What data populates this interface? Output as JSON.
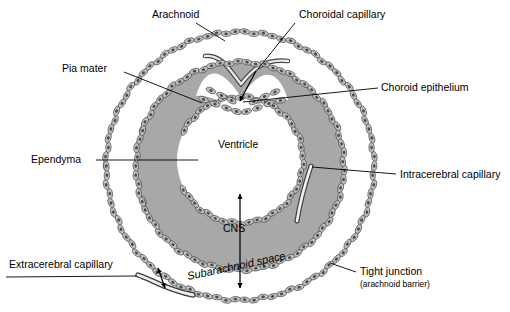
{
  "figure": {
    "background_color": "#ffffff",
    "cns_fill_color": "#a8a8a8",
    "cell_fill_color": "#b4b4b4",
    "line_color": "#000000",
    "vessel_fill_color": "#9a9a9a"
  },
  "labels": {
    "arachnoid": "Arachnoid",
    "choroidal_capillary": "Choroidal capillary",
    "pia_mater": "Pia mater",
    "choroid_epithelium": "Choroid epithelium",
    "ependyma": "Ependyma",
    "ventricle": "Ventricle",
    "intracerebral_capillary": "Intracerebral capillary",
    "cns": "CNS",
    "extracerebral_capillary": "Extracerebral capillary",
    "subarachnoid_space": "Subarachnoid space",
    "tight_junction": "Tight junction",
    "tight_junction_sub": "(arachnoid barrier)"
  },
  "geometry": {
    "outer_circle": {
      "cx": 240,
      "cy": 166,
      "r": 134,
      "name": "arachnoid-membrane"
    },
    "pia_circle": {
      "cx": 240,
      "cy": 166,
      "r": 104,
      "name": "pia-mater-membrane"
    },
    "ventricle_circle": {
      "cx": 240,
      "cy": 160,
      "r": 63,
      "name": "ependyma-lining"
    }
  }
}
